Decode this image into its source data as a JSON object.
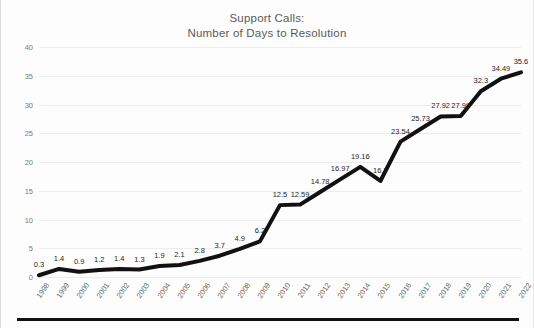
{
  "chart_data": {
    "type": "line",
    "title": "Support Calls:\nNumber of Days to Resolution",
    "title_line1": "Support Calls:",
    "title_line2": "Number of Days to Resolution",
    "xlabel": "",
    "ylabel": "",
    "ylim": [
      0,
      40
    ],
    "yticks": [
      0,
      5,
      10,
      15,
      20,
      25,
      30,
      35,
      40
    ],
    "grid": true,
    "legend": false,
    "line_color": "#111111",
    "categories": [
      "1998",
      "1999",
      "2000",
      "2001",
      "2002",
      "2003",
      "2004",
      "2005",
      "2006",
      "2007",
      "2008",
      "2009",
      "2010",
      "2011",
      "2012",
      "2013",
      "2014",
      "2015",
      "2016",
      "2017",
      "2018",
      "2019",
      "2020",
      "2021",
      "2022"
    ],
    "values": [
      0.3,
      1.4,
      0.9,
      1.2,
      1.4,
      1.3,
      1.9,
      2.1,
      2.8,
      3.7,
      4.9,
      6.2,
      12.5,
      12.59,
      14.78,
      16.97,
      19.16,
      16.7,
      23.54,
      25.73,
      27.92,
      27.99,
      32.3,
      34.49,
      35.6
    ],
    "data_labels": [
      "0.3",
      "1.4",
      "0.9",
      "1.2",
      "1.4",
      "1.3",
      "1.9",
      "2.1",
      "2.8",
      "3.7",
      "4.9",
      "6.2",
      "12.5",
      "12.59",
      "14.78",
      "16.97",
      "19.16",
      "16.7",
      "23.54",
      "25.73",
      "27.92",
      "27.99",
      "32.3",
      "34.49",
      "35.6"
    ]
  }
}
